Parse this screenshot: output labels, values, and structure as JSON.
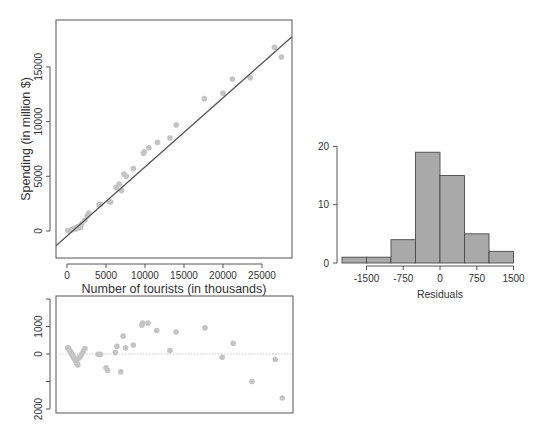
{
  "chart_data": [
    {
      "type": "scatter",
      "title": "",
      "xlabel": "Number of tourists (in thousands)",
      "ylabel": "Spending (in million $)",
      "xlim": [
        -1500,
        29000
      ],
      "ylim": [
        -2500,
        18700
      ],
      "xticks": [
        0,
        5000,
        10000,
        15000,
        20000,
        25000
      ],
      "xtick_labels": [
        "0",
        "5000",
        "10000",
        "15000",
        "20000",
        "25000"
      ],
      "yticks": [
        0,
        5000,
        10000,
        15000
      ],
      "ytick_labels": [
        "0",
        "5000",
        "10000",
        "15000"
      ],
      "regression_line": {
        "x": [
          -1500,
          29000
        ],
        "y": [
          -1350,
          17750
        ]
      },
      "points": [
        [
          100,
          50
        ],
        [
          300,
          20
        ],
        [
          500,
          80
        ],
        [
          700,
          150
        ],
        [
          900,
          200
        ],
        [
          1000,
          250
        ],
        [
          1100,
          180
        ],
        [
          1200,
          300
        ],
        [
          1300,
          350
        ],
        [
          1400,
          280
        ],
        [
          1500,
          420
        ],
        [
          1700,
          300
        ],
        [
          1900,
          650
        ],
        [
          2300,
          1000
        ],
        [
          2600,
          1400
        ],
        [
          2800,
          1650
        ],
        [
          4100,
          2400
        ],
        [
          4300,
          2450
        ],
        [
          5400,
          2700
        ],
        [
          5600,
          2650
        ],
        [
          6300,
          4000
        ],
        [
          6700,
          4300
        ],
        [
          7000,
          3700
        ],
        [
          7300,
          5200
        ],
        [
          7600,
          5000
        ],
        [
          8500,
          5700
        ],
        [
          9800,
          7100
        ],
        [
          9900,
          7250
        ],
        [
          10500,
          7600
        ],
        [
          11600,
          8100
        ],
        [
          13200,
          8500
        ],
        [
          14000,
          9700
        ],
        [
          17600,
          12100
        ],
        [
          20000,
          12600
        ],
        [
          21200,
          13900
        ],
        [
          23500,
          14000
        ],
        [
          26600,
          16800
        ],
        [
          27500,
          15900
        ]
      ]
    },
    {
      "type": "scatter",
      "title": "",
      "xlabel": "",
      "ylabel": "",
      "ylim": [
        -2100,
        2000
      ],
      "yticks": [
        2000,
        1000,
        0,
        -1000,
        -2000
      ],
      "ytick_labels": [
        "",
        "1000",
        "0",
        "",
        "2000"
      ],
      "reference_line": 0,
      "points": [
        [
          100,
          230
        ],
        [
          200,
          200
        ],
        [
          300,
          150
        ],
        [
          400,
          100
        ],
        [
          500,
          50
        ],
        [
          600,
          0
        ],
        [
          700,
          -50
        ],
        [
          800,
          -100
        ],
        [
          900,
          -150
        ],
        [
          1000,
          -200
        ],
        [
          1100,
          -250
        ],
        [
          1200,
          -300
        ],
        [
          1300,
          -350
        ],
        [
          1400,
          -400
        ],
        [
          1500,
          -150
        ],
        [
          1700,
          -100
        ],
        [
          1900,
          0
        ],
        [
          2100,
          100
        ],
        [
          2300,
          200
        ],
        [
          4000,
          -10
        ],
        [
          4300,
          -10
        ],
        [
          5000,
          -500
        ],
        [
          5200,
          -600
        ],
        [
          6200,
          50
        ],
        [
          6400,
          280
        ],
        [
          6900,
          -650
        ],
        [
          7200,
          650
        ],
        [
          7500,
          230
        ],
        [
          8500,
          330
        ],
        [
          9600,
          1050
        ],
        [
          9700,
          1130
        ],
        [
          10400,
          1130
        ],
        [
          11500,
          850
        ],
        [
          13200,
          130
        ],
        [
          14000,
          800
        ],
        [
          17700,
          950
        ],
        [
          19900,
          -120
        ],
        [
          21300,
          390
        ],
        [
          23700,
          -1000
        ],
        [
          26700,
          -200
        ],
        [
          27600,
          -1600
        ]
      ]
    },
    {
      "type": "bar",
      "title": "",
      "xlabel": "Residuals",
      "ylabel": "",
      "bin_edges": [
        -2000,
        -1500,
        -1000,
        -500,
        0,
        500,
        1000,
        1500
      ],
      "categories": [
        "-2000 to -1500",
        "-1500 to -1000",
        "-1000 to -500",
        "-500 to 0",
        "0 to 500",
        "500 to 1000",
        "1000 to 1500"
      ],
      "values": [
        1,
        1,
        4,
        19,
        15,
        5,
        2
      ],
      "xticks": [
        -1500,
        -750,
        0,
        750,
        1500
      ],
      "xtick_labels": [
        "-1500",
        "-750",
        "0",
        "750",
        "1500"
      ],
      "yticks": [
        0,
        10,
        20
      ],
      "ytick_labels": [
        "0",
        "10",
        "20"
      ],
      "ylim": [
        0,
        20
      ]
    }
  ],
  "colors": {
    "point": "#c4c4c4",
    "line": "#555555",
    "axis": "#555555",
    "bar_fill": "#a9a9a9",
    "bar_edge": "#4a4a4a",
    "zero_line": "#bbbbbb"
  }
}
